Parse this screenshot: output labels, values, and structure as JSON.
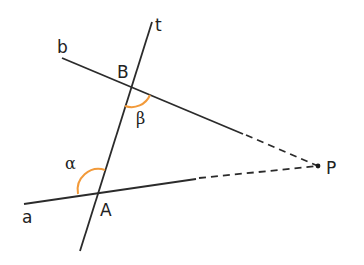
{
  "diagram": {
    "type": "geometry-transversal",
    "colors": {
      "line": "#2b2b2b",
      "arc": "#f29a3a",
      "background": "#ffffff"
    },
    "lines": {
      "a": {
        "label": "a"
      },
      "b": {
        "label": "b"
      },
      "t": {
        "label": "t"
      }
    },
    "points": {
      "A": {
        "label": "A"
      },
      "B": {
        "label": "B"
      },
      "P": {
        "label": "P"
      }
    },
    "angles": {
      "alpha": {
        "label": "α"
      },
      "beta": {
        "label": "β"
      }
    }
  }
}
